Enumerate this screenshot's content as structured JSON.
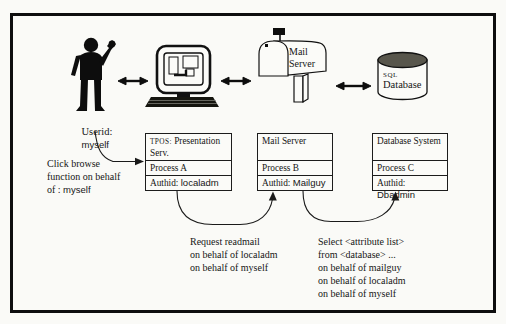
{
  "scene": {
    "user": {
      "label": "Userid:",
      "value": "myself"
    },
    "mailbox_icon": {
      "line1": "Mail",
      "line2": "Server"
    },
    "database_icon": {
      "line1": "SQL",
      "line2": "Database"
    },
    "boxes": [
      {
        "title_prefix": "TPOS:",
        "title": "Presentation Serv.",
        "process": "Process A",
        "auth_label": "Authid:",
        "auth_value": "localadm"
      },
      {
        "title": "Mail Server",
        "process": "Process B",
        "auth_label": "Authid:",
        "auth_value": "Mailguy"
      },
      {
        "title": "Database System",
        "process": "Process C",
        "auth_label": "Authid:",
        "auth_value": "Dbadmin"
      }
    ],
    "annotations": {
      "click": {
        "l1": "Click browse",
        "l2": "function on behalf",
        "l3_pre": "of : ",
        "l3_val": "myself"
      },
      "request": {
        "l1": "Request readmail",
        "l2": "on behalf of localadm",
        "l3": "on behalf of myself"
      },
      "select": {
        "l1": "Select <attribute list>",
        "l2": "from <database> ...",
        "l3": "on behalf of mailguy",
        "l4": "on behalf of localadm",
        "l5": "on behalf of myself"
      }
    },
    "colors": {
      "ink": "#161616",
      "paper": "#fafaf7",
      "cylinder_top": "#58564c"
    }
  }
}
